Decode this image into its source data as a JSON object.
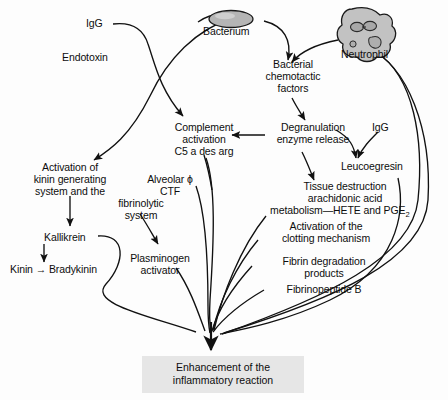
{
  "diagram": {
    "type": "flowchart",
    "title_visible": false,
    "colors": {
      "line": "#111111",
      "text": "#0d0d0d",
      "cell_fill": "#b5b5b5",
      "endbox_fill": "#e6e6e6",
      "background": "#fdfdfd"
    },
    "cells": [
      {
        "id": "bacterium",
        "label": "Bacterium",
        "shape": "ellipse",
        "fill": "#b5b5b5"
      },
      {
        "id": "neutrophil",
        "label": "Neutrophil",
        "shape": "blob",
        "fill": "#c2c2c2"
      }
    ],
    "nodes": [
      {
        "id": "igg_left",
        "label": "IgG"
      },
      {
        "id": "endotoxin",
        "label": "Endotoxin"
      },
      {
        "id": "bacterial_chemotactic",
        "label": "Bacterial\nchemotactic\nfactors"
      },
      {
        "id": "complement",
        "label": "Complement\nactivation\nC5 a des arg"
      },
      {
        "id": "degranulation",
        "label": "Degranulation\nenzyme release"
      },
      {
        "id": "igg_right",
        "label": "IgG"
      },
      {
        "id": "leucoegresin",
        "label": "Leucoegresin"
      },
      {
        "id": "kinin_system",
        "label": "Activation of\nkinin generating\nsystem and the"
      },
      {
        "id": "fibrinolytic",
        "label": "fibrinolytic\nsystem"
      },
      {
        "id": "alveolar",
        "label": "Alveolar ϕ\nCTF"
      },
      {
        "id": "kallikrein",
        "label": "Kallikrein"
      },
      {
        "id": "kinin_brady",
        "label": "Kinin → Bradykinin"
      },
      {
        "id": "plasminogen",
        "label": "Plasminogen\nactivator"
      },
      {
        "id": "tissue_destruction_l1",
        "label": "Tissue destruction"
      },
      {
        "id": "tissue_destruction_l2",
        "label": "arachidonic acid"
      },
      {
        "id": "tissue_destruction_l3",
        "label": "metabolism—HETE and PGE"
      },
      {
        "id": "tissue_destruction_l3_sub",
        "label": "2"
      },
      {
        "id": "clotting",
        "label": "Activation of the\nclotting mechanism"
      },
      {
        "id": "fibrin_degradation",
        "label": "Fibrin degradation\nproducts"
      },
      {
        "id": "fibrinopeptide",
        "label": "Fibrinopeptide B"
      }
    ],
    "outcome": {
      "line1": "Enhancement of the",
      "line2": "inflammatory reaction"
    },
    "labels": {
      "igg_left": "IgG",
      "bacterium": "Bacterium",
      "neutrophil": "Neutrophil",
      "endotoxin": "Endotoxin",
      "bacterial_chemotactic_1": "Bacterial",
      "bacterial_chemotactic_2": "chemotactic",
      "bacterial_chemotactic_3": "factors",
      "complement_1": "Complement",
      "complement_2": "activation",
      "complement_3": "C5 a des arg",
      "degranulation_1": "Degranulation",
      "degranulation_2": "enzyme release",
      "igg_right": "IgG",
      "leucoegresin": "Leucoegresin",
      "kinin_system_1": "Activation of",
      "kinin_system_2": "kinin generating",
      "kinin_system_3": "system and the",
      "alveolar_1": "Alveolar ϕ",
      "alveolar_2": "CTF",
      "fibrinolytic_1": "fibrinolytic",
      "fibrinolytic_2": "system",
      "kallikrein": "Kallikrein",
      "kinin_brady": "Kinin → Bradykinin",
      "plasminogen_1": "Plasminogen",
      "plasminogen_2": "activator",
      "tissue_1": "Tissue destruction",
      "tissue_2": "arachidonic acid",
      "tissue_3": "metabolism—HETE and PGE",
      "tissue_3_sub": "2",
      "clotting_1": "Activation of the",
      "clotting_2": "clotting mechanism",
      "fibrin_1": "Fibrin degradation",
      "fibrin_2": "products",
      "fibrinopeptide": "Fibrinopeptide B",
      "outcome_1": "Enhancement of the",
      "outcome_2": "inflammatory reaction"
    }
  }
}
